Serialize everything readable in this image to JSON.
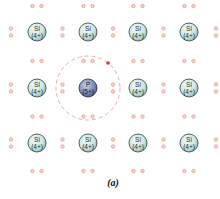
{
  "diagram": {
    "caption": "(a)",
    "lattice": {
      "columns_x": [
        37,
        88,
        138,
        189
      ],
      "rows_y": [
        32,
        88,
        143
      ],
      "atom_radius": 9
    },
    "atoms": [
      {
        "row": 0,
        "col": 0,
        "symbol": "Si",
        "charge": "(4+)"
      },
      {
        "row": 0,
        "col": 1,
        "symbol": "Si",
        "charge": "(4+)"
      },
      {
        "row": 0,
        "col": 2,
        "symbol": "Si",
        "charge": "(4+)"
      },
      {
        "row": 0,
        "col": 3,
        "symbol": "Si",
        "charge": "(4+)"
      },
      {
        "row": 1,
        "col": 0,
        "symbol": "Si",
        "charge": "(4+)"
      },
      {
        "row": 1,
        "col": 1,
        "symbol": "P",
        "charge": "(5+)",
        "dopant": true
      },
      {
        "row": 1,
        "col": 2,
        "symbol": "Si",
        "charge": "(4+)"
      },
      {
        "row": 1,
        "col": 3,
        "symbol": "Si",
        "charge": "(4+)"
      },
      {
        "row": 2,
        "col": 0,
        "symbol": "Si",
        "charge": "(4+)"
      },
      {
        "row": 2,
        "col": 1,
        "symbol": "Si",
        "charge": "(4+)"
      },
      {
        "row": 2,
        "col": 2,
        "symbol": "Si",
        "charge": "(4+)"
      },
      {
        "row": 2,
        "col": 3,
        "symbol": "Si",
        "charge": "(4+)"
      }
    ],
    "extra_electron": {
      "x": 108,
      "y": 63,
      "orbit_center": [
        88,
        88
      ],
      "orbit_radius": 32
    },
    "colors": {
      "si_fill": "#cfe6e2",
      "si_stroke": "#3b5553",
      "p_fill": "#7f8fb8",
      "p_stroke": "#2f3a5a",
      "electron_pair": "#e89a8c",
      "extra_electron": "#d33a2a",
      "orbit": "#e4a3a0"
    }
  }
}
